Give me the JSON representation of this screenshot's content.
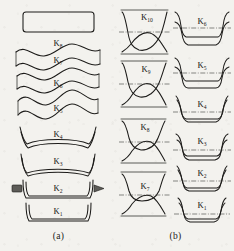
{
  "figure": {
    "background_color": "#f3f2ee",
    "line_color": "#1c1b19",
    "centerline_color": "#3a3936",
    "roller_color": "#5d5c58"
  },
  "panels": [
    {
      "id": "a",
      "caption": "(a)",
      "description": "Strip cross-section profiles per forming stand",
      "stages": [
        {
          "label": "K",
          "sub": "8",
          "shape": "flat-strip"
        },
        {
          "label": "K",
          "sub": "7",
          "shape": "wave"
        },
        {
          "label": "K",
          "sub": "6",
          "shape": "wave"
        },
        {
          "label": "K",
          "sub": "5",
          "shape": "wave"
        },
        {
          "label": "K",
          "sub": "4",
          "shape": "shallow-tray"
        },
        {
          "label": "K",
          "sub": "3",
          "shape": "tray"
        },
        {
          "label": "K",
          "sub": "2",
          "shape": "channel-with-rolls"
        },
        {
          "label": "K",
          "sub": "1",
          "shape": "channel"
        }
      ]
    },
    {
      "id": "b",
      "caption": "(b)",
      "description": "Roll pass profiles with dash-dot centerlines",
      "columns": [
        {
          "id": "b-left",
          "stages": [
            {
              "label": "K",
              "sub": "10",
              "shape": "pass-hourglass"
            },
            {
              "label": "K",
              "sub": "9",
              "shape": "pass-hourglass"
            },
            {
              "label": "K",
              "sub": "8",
              "shape": "pass-hourglass"
            },
            {
              "label": "K",
              "sub": "7",
              "shape": "pass-hourglass"
            }
          ]
        },
        {
          "id": "b-right",
          "stages": [
            {
              "label": "K",
              "sub": "6",
              "shape": "pass-channel"
            },
            {
              "label": "K",
              "sub": "5",
              "shape": "pass-channel"
            },
            {
              "label": "K",
              "sub": "4",
              "shape": "pass-flat"
            },
            {
              "label": "K",
              "sub": "3",
              "shape": "pass-channel"
            },
            {
              "label": "K",
              "sub": "2",
              "shape": "pass-flat"
            },
            {
              "label": "K",
              "sub": "1",
              "shape": "pass-channel"
            }
          ]
        }
      ]
    }
  ]
}
